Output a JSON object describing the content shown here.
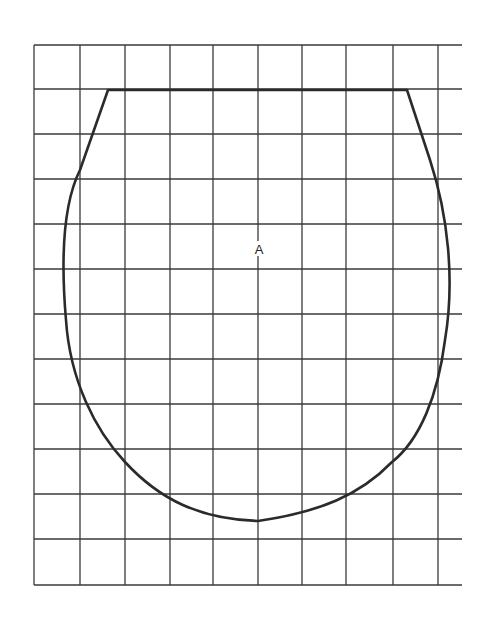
{
  "diagram": {
    "type": "pattern-piece-on-grid",
    "label": "A",
    "colors": {
      "grid": "#3a3a3a",
      "outline": "#2b2b2b",
      "background": "#ffffff"
    },
    "grid": {
      "vertical_x": [
        34,
        80,
        125,
        170,
        213,
        258,
        302,
        346,
        393,
        438
      ],
      "horizontal_y": [
        45,
        89,
        134,
        179,
        224,
        269,
        314,
        359,
        404,
        449,
        494,
        539,
        585
      ],
      "x_extent": [
        34,
        462
      ],
      "y_extent": [
        45,
        585
      ]
    },
    "outline_path": "M108,90 L407,90 L430,160 C448,215 455,280 445,340 C438,395 420,440 392,462 C360,495 320,512 258,521 C200,519 160,500 125,462 C95,430 70,380 66,320 C60,250 65,200 80,170 Z"
  }
}
